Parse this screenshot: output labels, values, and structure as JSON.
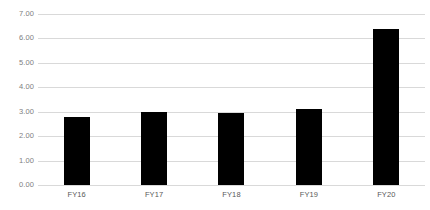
{
  "chart_data": {
    "type": "bar",
    "title": "",
    "subtitle": "",
    "xlabel": "",
    "ylabel": "",
    "categories": [
      "FY16",
      "FY17",
      "FY18",
      "FY19",
      "FY20"
    ],
    "values": [
      2.8,
      3.0,
      2.95,
      3.1,
      6.4
    ],
    "ylim": [
      0.0,
      7.0
    ],
    "ytick_step": 1.0,
    "ytick_labels": [
      "0.00",
      "1.00",
      "2.00",
      "3.00",
      "4.00",
      "5.00",
      "6.00",
      "7.00"
    ],
    "ytick_values": [
      0,
      1,
      2,
      3,
      4,
      5,
      6,
      7
    ],
    "grid": true,
    "grid_axis": "y",
    "legend": false,
    "legend_position": "none",
    "annotations": [],
    "data_labels": false,
    "colors": {
      "bar": "#000000",
      "gridline": "#d9d9d9",
      "background": "#ffffff",
      "ytick_text": "#808080",
      "xtick_text": "#595959"
    }
  }
}
